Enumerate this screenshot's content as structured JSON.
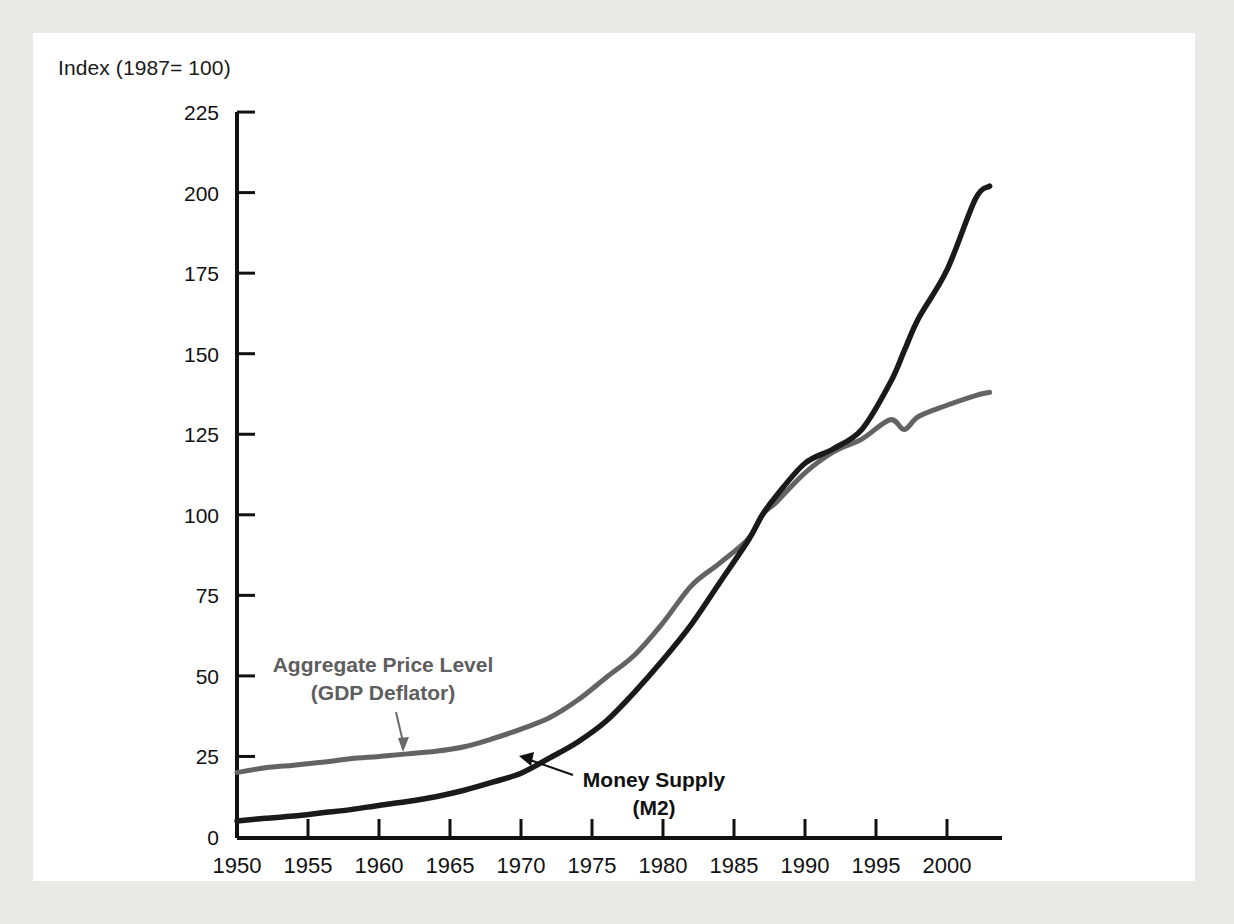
{
  "figure": {
    "title": "Index (1987= 100)",
    "background_color": "#e9e9e7",
    "panel_color": "#ffffff"
  },
  "chart_data": {
    "type": "line",
    "title": "Index (1987= 100)",
    "xlabel": "",
    "ylabel": "Index (1987= 100)",
    "xlim": [
      1950,
      2003
    ],
    "ylim": [
      0,
      225
    ],
    "grid": false,
    "legend_position": "inline-annotations",
    "yticks": [
      0,
      25,
      50,
      75,
      100,
      125,
      150,
      175,
      200,
      225
    ],
    "ytick_labels": [
      "0",
      "25",
      "50",
      "75",
      "100",
      "125",
      "150",
      "175",
      "200",
      "225"
    ],
    "xticks": [
      1950,
      1955,
      1960,
      1965,
      1970,
      1975,
      1980,
      1985,
      1990,
      1995,
      2000
    ],
    "xtick_labels": [
      "1950",
      "1955",
      "1960",
      "1965",
      "1970",
      "1975",
      "1980",
      "1985",
      "1990",
      "1995",
      "2000"
    ],
    "x": [
      1950,
      1952,
      1954,
      1956,
      1958,
      1960,
      1962,
      1964,
      1966,
      1968,
      1970,
      1972,
      1974,
      1976,
      1978,
      1980,
      1982,
      1984,
      1986,
      1987,
      1988,
      1990,
      1992,
      1994,
      1996,
      1997,
      1998,
      2000,
      2002,
      2003
    ],
    "series": [
      {
        "name": "Aggregate Price Level (GDP Deflator)",
        "color": "#636363",
        "values": [
          20,
          21.5,
          22.3,
          23.2,
          24.3,
          25,
          25.8,
          26.6,
          28,
          30.5,
          33.5,
          37,
          42.5,
          49.5,
          56.5,
          66.5,
          78,
          85,
          92.5,
          100,
          104,
          113,
          119.5,
          123.5,
          129.5,
          126.5,
          130.5,
          134,
          137,
          138
        ]
      },
      {
        "name": "Money Supply (M2)",
        "color": "#1a1a1a",
        "values": [
          5,
          5.8,
          6.5,
          7.5,
          8.5,
          9.8,
          11,
          12.5,
          14.5,
          17,
          19.8,
          24.5,
          29.5,
          36,
          45,
          55,
          66,
          79,
          92,
          100,
          106,
          116,
          120.5,
          126.5,
          141,
          151,
          161,
          176,
          198,
          202
        ]
      }
    ],
    "annotations": [
      {
        "name": "aggregate-price-level-label",
        "lines": [
          "Aggregate Price Level",
          "(GDP Deflator)"
        ],
        "color": "#5e5e5e",
        "points_to_year": 1962,
        "points_to_value": 26
      },
      {
        "name": "money-supply-label",
        "lines": [
          "Money Supply",
          "(M2)"
        ],
        "color": "#111111",
        "points_to_year": 1973,
        "points_to_value": 26
      }
    ]
  },
  "axis_geometry": {
    "x0_px": 237,
    "y0_px": 837,
    "px_per_year": 14.2,
    "px_per_unit": 3.222
  }
}
